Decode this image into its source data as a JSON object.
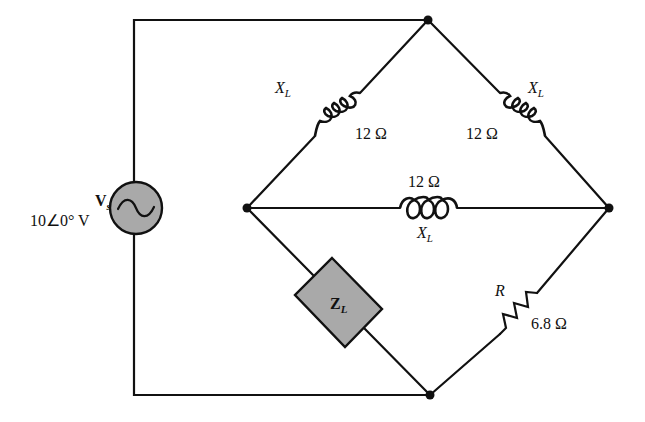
{
  "diagram": {
    "type": "bridge circuit",
    "colors": {
      "line": "#111111",
      "component_fill": "#a9a9a9",
      "background": "#ffffff"
    },
    "source": {
      "symbol": "V",
      "subscript": "s",
      "value": "10∠0° V",
      "icon": "ac-source-sine-icon"
    },
    "inductor_top_left": {
      "name": "X",
      "subscript": "L",
      "value": "12 Ω"
    },
    "inductor_top_right": {
      "name": "X",
      "subscript": "L",
      "value": "12 Ω"
    },
    "inductor_middle": {
      "name": "X",
      "subscript": "L",
      "value": "12 Ω"
    },
    "load": {
      "name": "Z",
      "subscript": "L"
    },
    "resistor": {
      "name": "R",
      "value": "6.8 Ω"
    },
    "nodes": [
      "top",
      "left",
      "right",
      "bottom"
    ]
  }
}
